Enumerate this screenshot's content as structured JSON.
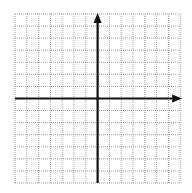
{
  "diagram": {
    "type": "coordinate-plane",
    "colors": {
      "background": "#ffffff",
      "grid": "#8a8a8a",
      "axis": "#111111"
    },
    "grid": {
      "left": 15,
      "top": 14,
      "columns": 14,
      "rows": 14,
      "cell_width": 11.8,
      "cell_height": 12.07,
      "style": "dotted"
    },
    "axes": {
      "origin_col": 7,
      "origin_row": 7,
      "x_axis": {
        "arrow": "right",
        "extends_left_to_edge": true
      },
      "y_axis": {
        "arrow": "up",
        "extends_down_to_edge": true
      }
    },
    "labels": []
  }
}
